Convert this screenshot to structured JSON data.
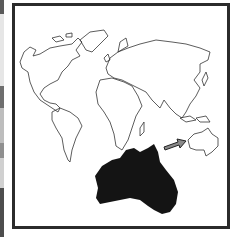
{
  "figure": {
    "highlighted_region": "Australia",
    "colors": {
      "frame": "#2b2b2b",
      "outline": "#333333",
      "highlight_fill": "#141414",
      "arrow_fill": "#8a8a8a",
      "background": "#ffffff"
    },
    "side_strip_bands": [
      "#5a5a5a",
      "#e6e6e6",
      "#6e6e6e",
      "#bdbdbd",
      "#e8e8e8",
      "#7a7a7a",
      "#d0d0d0",
      "#4d4d4d"
    ]
  }
}
